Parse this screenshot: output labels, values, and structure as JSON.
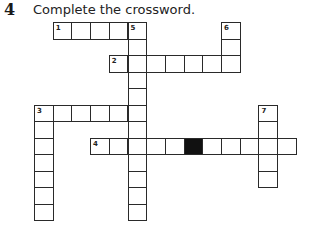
{
  "exercise": {
    "number": "4",
    "instruction": "Complete the crossword."
  },
  "grid": {
    "origin_x": 34,
    "origin_y": 22,
    "cell_w": 18.7,
    "cell_h": 16.5,
    "black_cells": [
      [
        7,
        8
      ]
    ],
    "entries": [
      {
        "number": "1",
        "direction": "across",
        "row": 0,
        "col": 1,
        "length": 5
      },
      {
        "number": "2",
        "direction": "across",
        "row": 2,
        "col": 4,
        "length": 7
      },
      {
        "number": "3",
        "direction": "across",
        "row": 5,
        "col": 0,
        "length": 6
      },
      {
        "number": "4",
        "direction": "across",
        "row": 7,
        "col": 3,
        "length": 11
      },
      {
        "number": "3",
        "direction": "down",
        "row": 5,
        "col": 0,
        "length": 7
      },
      {
        "number": "5",
        "direction": "down",
        "row": 0,
        "col": 5,
        "length": 12
      },
      {
        "number": "6",
        "direction": "down",
        "row": 0,
        "col": 10,
        "length": 3
      },
      {
        "number": "7",
        "direction": "down",
        "row": 5,
        "col": 12,
        "length": 5
      }
    ]
  }
}
